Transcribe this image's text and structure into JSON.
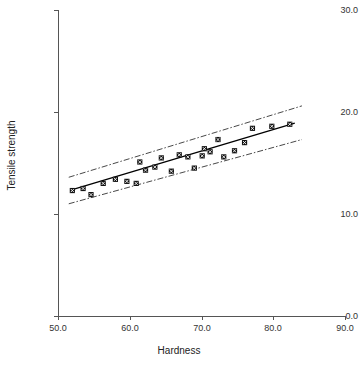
{
  "title_clipped": "Fitted line plot with confidence bands",
  "chart_data": {
    "type": "scatter",
    "title": "",
    "xlabel": "Hardness",
    "ylabel": "Tensile strength",
    "xlim": [
      50.0,
      90.0
    ],
    "ylim": [
      0.0,
      30.0
    ],
    "xticks": [
      "50.0",
      "60.0",
      "70.0",
      "80.0",
      "90.0"
    ],
    "yticks": [
      "0.0",
      "10.0",
      "20.0",
      "30.0"
    ],
    "xtick_values": [
      50.0,
      60.0,
      70.0,
      80.0,
      90.0
    ],
    "ytick_values": [
      0.0,
      10.0,
      20.0,
      30.0
    ],
    "grid": false,
    "legend": "none",
    "marker_style": "filled-square-with-x",
    "series": [
      {
        "name": "Observations",
        "type": "scatter",
        "points": [
          [
            52.0,
            12.3
          ],
          [
            53.5,
            12.5
          ],
          [
            54.6,
            11.9
          ],
          [
            56.3,
            13.0
          ],
          [
            58.0,
            13.4
          ],
          [
            59.6,
            13.2
          ],
          [
            60.9,
            13.0
          ],
          [
            61.4,
            15.1
          ],
          [
            62.2,
            14.3
          ],
          [
            63.5,
            14.6
          ],
          [
            64.4,
            15.5
          ],
          [
            65.8,
            14.2
          ],
          [
            66.9,
            15.8
          ],
          [
            68.1,
            15.6
          ],
          [
            69.0,
            14.5
          ],
          [
            70.1,
            15.7
          ],
          [
            70.4,
            16.4
          ],
          [
            71.2,
            16.1
          ],
          [
            72.3,
            17.3
          ],
          [
            73.1,
            15.6
          ],
          [
            74.6,
            16.2
          ],
          [
            76.0,
            17.0
          ],
          [
            77.1,
            18.4
          ],
          [
            79.8,
            18.6
          ],
          [
            82.3,
            18.8
          ]
        ]
      },
      {
        "name": "Regression line",
        "type": "line",
        "style": "solid",
        "points": [
          [
            52.0,
            12.4
          ],
          [
            83.0,
            18.9
          ]
        ]
      },
      {
        "name": "Upper band",
        "type": "line",
        "style": "dash-dot",
        "points": [
          [
            51.5,
            13.6
          ],
          [
            84.0,
            20.6
          ]
        ]
      },
      {
        "name": "Lower band",
        "type": "line",
        "style": "dash-dot",
        "points": [
          [
            51.5,
            11.0
          ],
          [
            84.0,
            17.3
          ]
        ]
      }
    ]
  },
  "colors": {
    "axis": "#555555",
    "marker": "#111111",
    "fit_line": "#000000",
    "band_line": "#333333",
    "background": "#ffffff"
  }
}
